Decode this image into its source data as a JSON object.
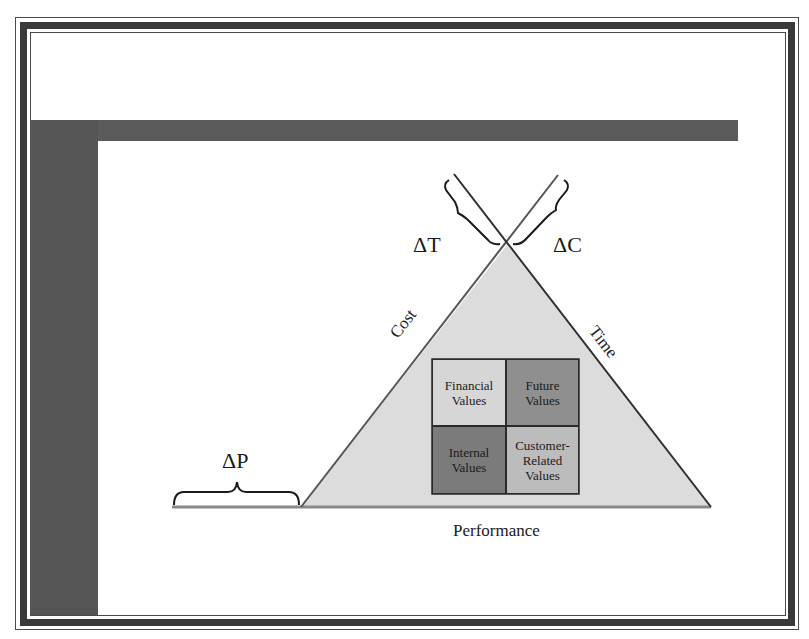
{
  "diagram": {
    "type": "project-triangle",
    "labels": {
      "delta_t": "ΔT",
      "delta_c": "ΔC",
      "delta_p": "ΔP",
      "cost": "Cost",
      "time": "Time",
      "performance": "Performance"
    },
    "grid": {
      "cells": [
        {
          "id": "financial",
          "line1": "Financial",
          "line2": "Values",
          "line3": "",
          "color": "#d6d6d6"
        },
        {
          "id": "future",
          "line1": "Future",
          "line2": "Values",
          "line3": "",
          "color": "#8f8f8f"
        },
        {
          "id": "internal",
          "line1": "Internal",
          "line2": "Values",
          "line3": "",
          "color": "#7b7b7b"
        },
        {
          "id": "customer",
          "line1": "Customer-",
          "line2": "Related",
          "line3": "Values",
          "color": "#bcbcbc"
        }
      ]
    },
    "colors": {
      "triangle_fill": "#dcdcdc",
      "line": "#2e2e2e",
      "frame": "#3a3a3a",
      "bars": "#585858"
    }
  }
}
